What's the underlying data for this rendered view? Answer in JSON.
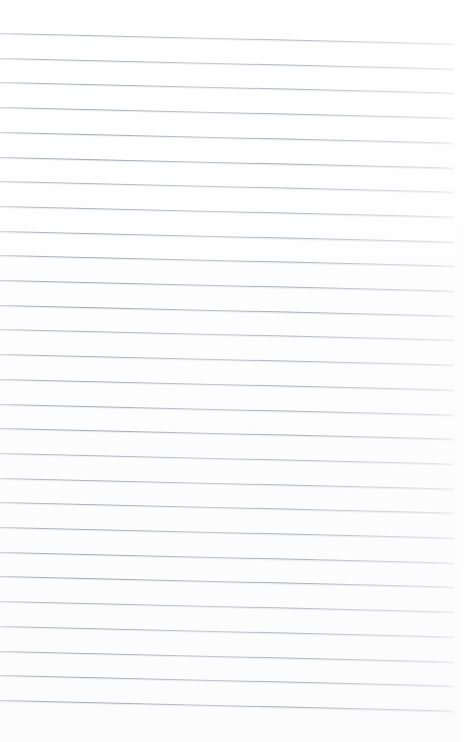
{
  "document": {
    "kind": "blank-ruled-notepad-page",
    "title": "Blank Ruled Notepad Page",
    "background_color": "#fefefe",
    "page_width": 468,
    "page_height": 742,
    "has_text": false,
    "has_handwriting": false,
    "has_margin_rule": false,
    "body_text": ""
  },
  "rules": {
    "line_color": "#a6aab0",
    "line_thickness": 1,
    "line_count": 28,
    "first_line_y": 33,
    "line_spacing": 24.7,
    "line_start_x": 0,
    "line_end_x": 454,
    "slant_drop_px": 10.5,
    "orientation": "slightly-tilted-down-right"
  },
  "margins": {
    "top": 33,
    "bottom": 27,
    "left": 0,
    "right": 14
  }
}
